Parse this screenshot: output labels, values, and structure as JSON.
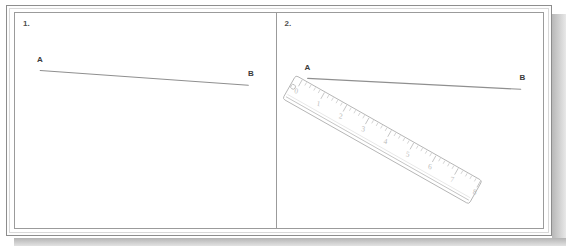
{
  "figure": {
    "panel_count": 2,
    "colors": {
      "frame_outer": "#8d8d8d",
      "frame_inner": "#d8d8d8",
      "panel_border": "#9b9b9b",
      "segment_line": "#8f8f8f",
      "ruler_outline": "#b4b4b4",
      "ruler_tick": "#bdbdbd",
      "ruler_numeral": "#bcbcbc",
      "label_text": "#3b3b3b",
      "shadow": "#b4b4b4",
      "background": "#ffffff"
    }
  },
  "panels": [
    {
      "number": "1.",
      "name": "segment-only",
      "labels": {
        "start": "A",
        "end": "B"
      },
      "segment": {
        "x1": 25,
        "y1": 58,
        "x2": 235,
        "y2": 73
      },
      "label_positions": {
        "start": {
          "x": 22,
          "y": 42
        },
        "end": {
          "x": 233,
          "y": 56
        }
      },
      "has_ruler": false
    },
    {
      "number": "2.",
      "name": "segment-with-ruler",
      "labels": {
        "start": "A",
        "end": "B"
      },
      "segment": {
        "x1": 30,
        "y1": 66,
        "x2": 245,
        "y2": 77
      },
      "label_positions": {
        "start": {
          "x": 28,
          "y": 50
        },
        "end": {
          "x": 243,
          "y": 60
        }
      },
      "has_ruler": true
    }
  ],
  "ruler": {
    "name": "measuring-ruler",
    "unit_count": 8,
    "numerals": [
      "0",
      "1",
      "2",
      "3",
      "4",
      "5",
      "6",
      "7",
      "8"
    ],
    "minor_ticks_per_unit": 4,
    "has_hanging_hole": true,
    "angle_degrees": 29.5,
    "length_px": 216,
    "width_px": 27,
    "origin": {
      "x": 18,
      "y": 63
    }
  }
}
